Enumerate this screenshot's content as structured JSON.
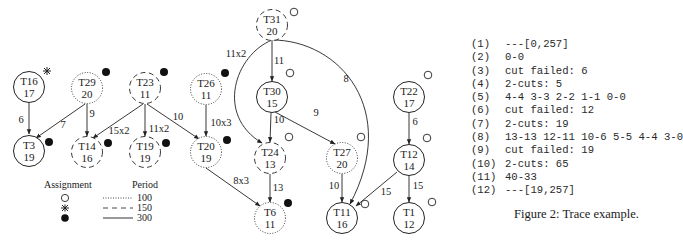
{
  "nodes": [
    {
      "id": "T16",
      "value": "17",
      "x": 29,
      "y": 87,
      "period": 300,
      "assignment": "star",
      "mark_x": 47,
      "mark_y": 71
    },
    {
      "id": "T29",
      "value": "20",
      "x": 87,
      "y": 88,
      "period": 100,
      "assignment": "filled",
      "mark_x": 106,
      "mark_y": 72
    },
    {
      "id": "T23",
      "value": "11",
      "x": 145,
      "y": 88,
      "period": 150,
      "assignment": "filled",
      "mark_x": 164,
      "mark_y": 72
    },
    {
      "id": "T26",
      "value": "11",
      "x": 206,
      "y": 89,
      "period": 100,
      "assignment": "filled",
      "mark_x": 225,
      "mark_y": 73
    },
    {
      "id": "T3",
      "value": "19",
      "x": 29,
      "y": 151,
      "period": 300,
      "assignment": "filled",
      "mark_x": 49,
      "mark_y": 142
    },
    {
      "id": "T14",
      "value": "16",
      "x": 87,
      "y": 152,
      "period": 150,
      "assignment": "filled",
      "mark_x": 108,
      "mark_y": 143
    },
    {
      "id": "T19",
      "value": "19",
      "x": 145,
      "y": 152,
      "period": 150,
      "assignment": "filled",
      "mark_x": 166,
      "mark_y": 143
    },
    {
      "id": "T20",
      "value": "19",
      "x": 206,
      "y": 152,
      "period": 100,
      "assignment": "filled",
      "mark_x": 227,
      "mark_y": 140
    },
    {
      "id": "T31",
      "value": "20",
      "x": 272,
      "y": 25,
      "period": 150,
      "assignment": "open",
      "mark_x": 294,
      "mark_y": 12
    },
    {
      "id": "T30",
      "value": "15",
      "x": 272,
      "y": 97,
      "period": 300,
      "assignment": "open",
      "mark_x": 290,
      "mark_y": 73
    },
    {
      "id": "T24",
      "value": "13",
      "x": 270,
      "y": 158,
      "period": 150,
      "assignment": "open",
      "mark_x": 289,
      "mark_y": 137
    },
    {
      "id": "T27",
      "value": "20",
      "x": 342,
      "y": 158,
      "period": 100,
      "assignment": "open",
      "mark_x": 361,
      "mark_y": 137
    },
    {
      "id": "T6",
      "value": "11",
      "x": 270,
      "y": 218,
      "period": 100,
      "assignment": "filled",
      "mark_x": 288,
      "mark_y": 203
    },
    {
      "id": "T11",
      "value": "16",
      "x": 342,
      "y": 218,
      "period": 300,
      "assignment": "open",
      "mark_x": 365,
      "mark_y": 204
    },
    {
      "id": "T22",
      "value": "17",
      "x": 409,
      "y": 97,
      "period": 300,
      "assignment": "open",
      "mark_x": 428,
      "mark_y": 75
    },
    {
      "id": "T12",
      "value": "14",
      "x": 409,
      "y": 160,
      "period": 300,
      "assignment": "open",
      "mark_x": 427,
      "mark_y": 138
    },
    {
      "id": "T1",
      "value": "12",
      "x": 409,
      "y": 218,
      "period": 300,
      "assignment": "open",
      "mark_x": 432,
      "mark_y": 202
    }
  ],
  "edges": [
    {
      "from": "T16",
      "to": "T3",
      "label": "6",
      "path": "M29,103 L29,134",
      "lx": 21,
      "ly": 123
    },
    {
      "from": "T29",
      "to": "T3",
      "label": "7",
      "path": "M85,104 L36,138",
      "lx": 63,
      "ly": 128
    },
    {
      "from": "T29",
      "to": "T14",
      "label": "9",
      "path": "M87,104 L87,136",
      "lx": 92,
      "ly": 117
    },
    {
      "from": "T23",
      "to": "T14",
      "label": "15x2",
      "path": "M143,104 L93,138",
      "lx": 119,
      "ly": 134
    },
    {
      "from": "T23",
      "to": "T19",
      "label": "11x2",
      "path": "M145,104 L145,136",
      "lx": 159,
      "ly": 132
    },
    {
      "from": "T23",
      "to": "T20",
      "label": "10",
      "path": "M147,104 L199,139",
      "lx": 178,
      "ly": 120
    },
    {
      "from": "T26",
      "to": "T20",
      "label": "10x3",
      "path": "M206,105 L206,136",
      "lx": 221,
      "ly": 126
    },
    {
      "from": "T20",
      "to": "T6",
      "label": "8x3",
      "path": "M206,168 L260,206",
      "lx": 241,
      "ly": 184
    },
    {
      "from": "T31",
      "to": "T30",
      "label": "11",
      "path": "M272,40 L272,81",
      "lx": 279,
      "ly": 64
    },
    {
      "from": "T31",
      "to": "T24",
      "label": "11x2",
      "path": "M272,40 C235,55 215,115 262,143",
      "lx": 236,
      "ly": 57
    },
    {
      "from": "T31",
      "to": "T11",
      "label": "8",
      "path": "M272,40 C340,40 400,110 350,204",
      "lx": 346,
      "ly": 82
    },
    {
      "from": "T30",
      "to": "T24",
      "label": "10",
      "path": "M271,113 L270,142",
      "lx": 279,
      "ly": 123
    },
    {
      "from": "T30",
      "to": "T27",
      "label": "9",
      "path": "M275,112 L335,144",
      "lx": 316,
      "ly": 116
    },
    {
      "from": "T24",
      "to": "T6",
      "label": "13",
      "path": "M270,174 L270,202",
      "lx": 278,
      "ly": 191
    },
    {
      "from": "T27",
      "to": "T11",
      "label": "10",
      "path": "M342,174 L342,202",
      "lx": 334,
      "ly": 189
    },
    {
      "from": "T12",
      "to": "T11",
      "label": "15",
      "path": "M397,172 L356,206",
      "lx": 386,
      "ly": 195
    },
    {
      "from": "T22",
      "to": "T12",
      "label": "6",
      "path": "M409,113 L409,144",
      "lx": 415,
      "ly": 125
    },
    {
      "from": "T12",
      "to": "T1",
      "label": "15",
      "path": "M409,176 L409,202",
      "lx": 418,
      "ly": 189
    }
  ],
  "legend": {
    "assignment_title": "Assignment",
    "assignment_items": [
      "open-circle",
      "star",
      "filled-circle"
    ],
    "period_title": "Period",
    "period_items": [
      {
        "style": "dotted",
        "label": "100"
      },
      {
        "style": "dashed",
        "label": "150"
      },
      {
        "style": "solid",
        "label": "300"
      }
    ]
  },
  "trace": [
    {
      "num": "(1)",
      "text": "---[0,257]"
    },
    {
      "num": "(2)",
      "text": "0-0"
    },
    {
      "num": "(3)",
      "text": "cut failed: 6"
    },
    {
      "num": "(4)",
      "text": "2-cuts: 5"
    },
    {
      "num": "(5)",
      "text": "4-4 3-3 2-2 1-1 0-0"
    },
    {
      "num": "(6)",
      "text": "cut failed: 12"
    },
    {
      "num": "(7)",
      "text": "2-cuts: 19"
    },
    {
      "num": "(8)",
      "text": "13-13 12-11 10-6 5-5 4-4 3-0"
    },
    {
      "num": "(9)",
      "text": "cut failed: 19"
    },
    {
      "num": "(10)",
      "text": "2-cuts: 65"
    },
    {
      "num": "(11)",
      "text": "40-33"
    },
    {
      "num": "(12)",
      "text": "---[19,257]"
    }
  ],
  "caption": "Figure 2: Trace example."
}
